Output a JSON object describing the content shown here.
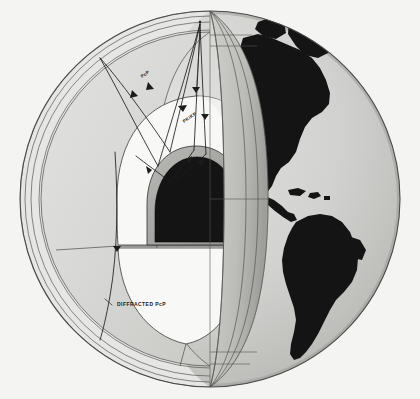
{
  "figure": {
    "background_color": "#f4f4f3"
  },
  "labels": {
    "pcp": "PcP",
    "pkikp": "PKiKP",
    "diffracted_pcp": "DIFFRACTED PcP"
  },
  "layers": [
    {
      "name": "crust",
      "color": "#e9e9e7"
    },
    {
      "name": "mantle",
      "color": "#d9d9d7"
    },
    {
      "name": "outer-core",
      "color": "#f7f7f6"
    },
    {
      "name": "transition-shell",
      "color": "#a8a8a6"
    },
    {
      "name": "inner-core",
      "color": "#141414"
    },
    {
      "name": "sphere-surface",
      "color": "#cfcfcd"
    },
    {
      "name": "continents",
      "color": "#141414"
    }
  ],
  "colors": {
    "outline": "#2a2a2a",
    "ray": "#1c1c1c",
    "sphere_light": "#dcdcda",
    "sphere_dark": "#b4b4b1",
    "inner_core": "#141414",
    "core_shell": "#a6a6a3",
    "mantle": "#d8d8d6",
    "outer_core": "#f8f8f7"
  }
}
